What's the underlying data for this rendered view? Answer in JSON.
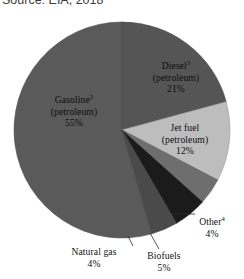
{
  "caption": {
    "text": "Source: EIA, 2018",
    "truncated": true
  },
  "chart_data": {
    "type": "pie",
    "title": "",
    "subtitle": "",
    "xlabel": "",
    "ylabel": "",
    "legend_position": "none",
    "grid": false,
    "value_unit": "%",
    "start_angle_deg": 0,
    "direction": "clockwise",
    "categories": [
      "Diesel (petroleum)",
      "Jet fuel (petroleum)",
      "Other",
      "Biofuels",
      "Natural gas",
      "Gasoline (petroleum)"
    ],
    "values": [
      21,
      12,
      4,
      5,
      4,
      55
    ],
    "colors": [
      "#555555",
      "#bdbdbd",
      "#6e6e6e",
      "#1b1b1b",
      "#4a4a4a",
      "#5a5a5a"
    ],
    "slices": [
      {
        "name": "diesel",
        "label_lines": [
          "Diesel",
          "(petroleum)",
          "21%"
        ],
        "footnote": "3",
        "value": 21,
        "color": "#555555",
        "label_placement": "inside"
      },
      {
        "name": "jet-fuel",
        "label_lines": [
          "Jet fuel",
          "(petroleum)",
          "12%"
        ],
        "footnote": "",
        "value": 12,
        "color": "#bdbdbd",
        "label_placement": "inside"
      },
      {
        "name": "other",
        "label_lines": [
          "Other",
          "4%"
        ],
        "footnote": "4",
        "value": 4,
        "color": "#6e6e6e",
        "label_placement": "outside-leader"
      },
      {
        "name": "biofuels",
        "label_lines": [
          "Biofuels",
          "5%"
        ],
        "footnote": "",
        "value": 5,
        "color": "#1b1b1b",
        "label_placement": "outside-leader"
      },
      {
        "name": "natural-gas",
        "label_lines": [
          "Natural gas",
          "4%"
        ],
        "footnote": "",
        "value": 4,
        "color": "#4a4a4a",
        "label_placement": "outside-leader"
      },
      {
        "name": "gasoline",
        "label_lines": [
          "Gasoline",
          "(petroleum)",
          "55%"
        ],
        "footnote": "2",
        "value": 55,
        "color": "#5a5a5a",
        "label_placement": "inside"
      }
    ]
  },
  "labels": {
    "diesel": {
      "line1": "Diesel",
      "sup": "3",
      "line2": "(petroleum)",
      "line3": "21%"
    },
    "gasoline": {
      "line1": "Gasoline",
      "sup": "2",
      "line2": "(petroleum)",
      "line3": "55%"
    },
    "jetfuel": {
      "line1": "Jet fuel",
      "sup": "",
      "line2": "(petroleum)",
      "line3": "12%"
    },
    "other": {
      "line1": "Other",
      "sup": "4",
      "line2": "4%"
    },
    "natural_gas": {
      "line1": "Natural gas",
      "line2": "4%"
    },
    "biofuels": {
      "line1": "Biofuels",
      "line2": "5%"
    }
  }
}
